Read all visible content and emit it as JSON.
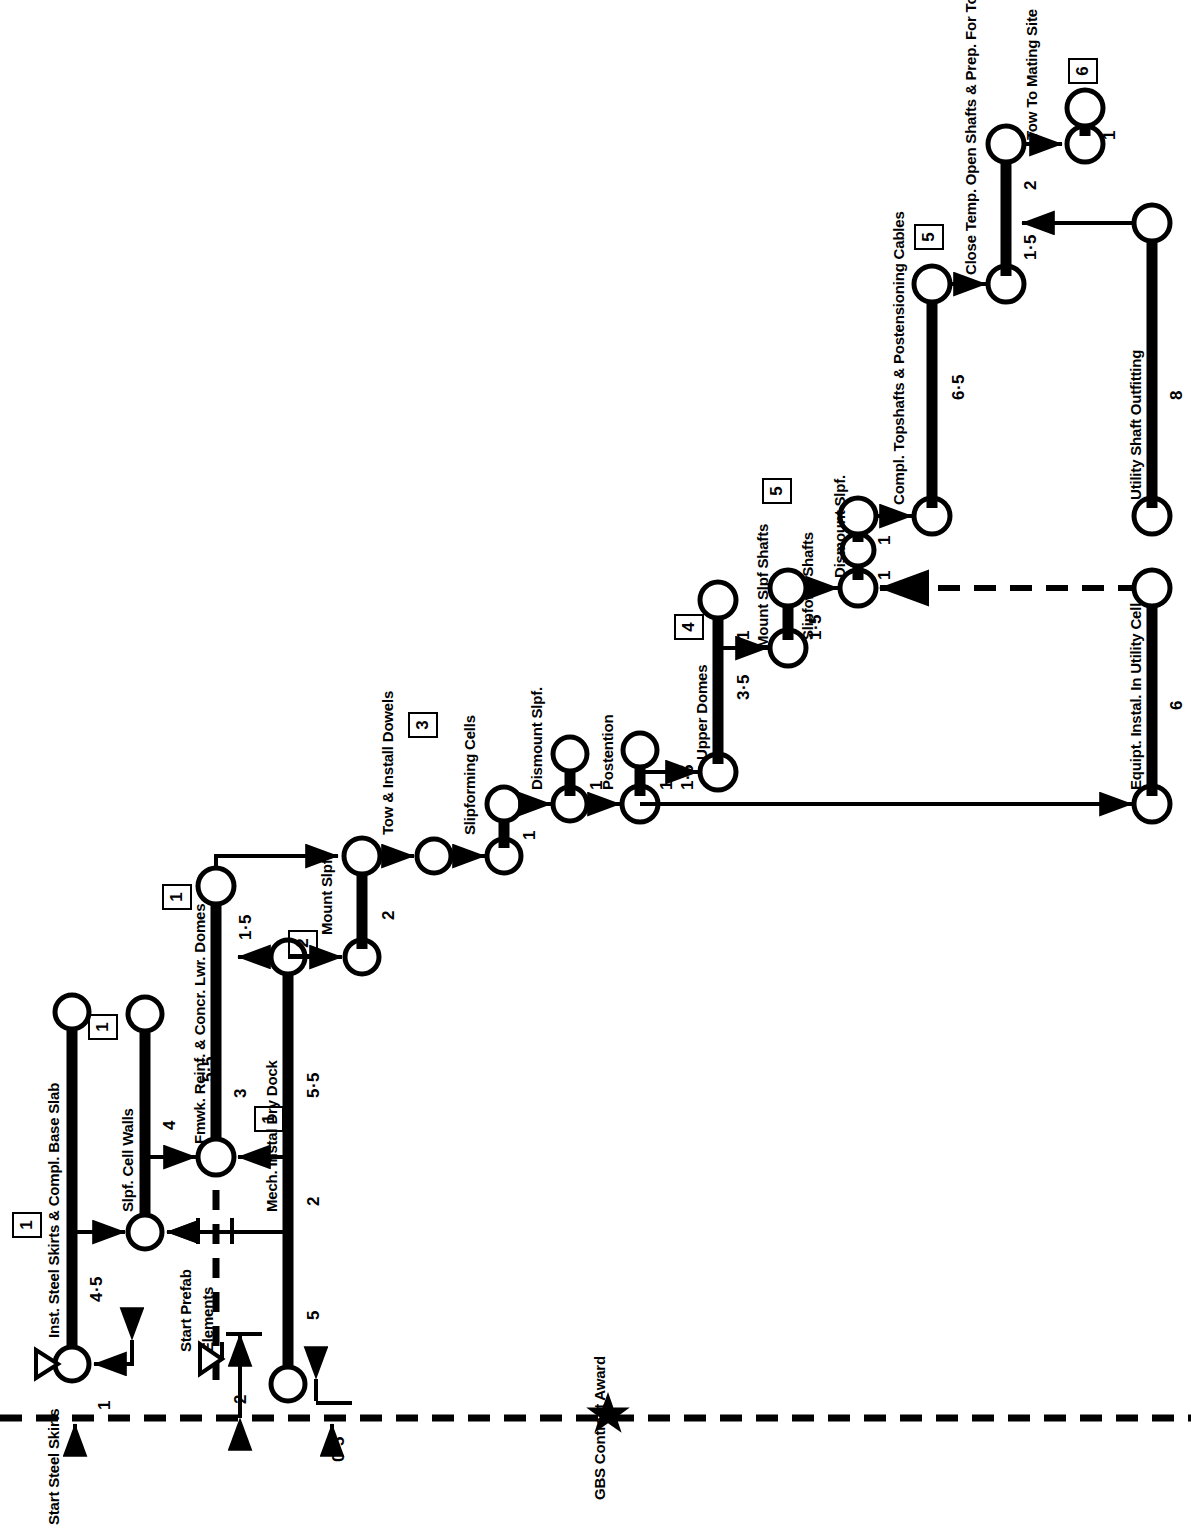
{
  "diagram": {
    "type": "cpm-arrow-network",
    "orientation": "rotated-90-ccw",
    "baseline_label": "GBS Contract Award",
    "milestones": [
      "1",
      "1",
      "1",
      "1",
      "2",
      "3",
      "4",
      "5",
      "5",
      "6"
    ],
    "events": [
      {
        "id": "start-steel-skirts",
        "label": "Start Steel Skirts"
      },
      {
        "id": "start-prefab-elements",
        "label": "Start Prefab Elements"
      },
      {
        "id": "gbs-contract-award",
        "label": "GBS Contract Award"
      }
    ],
    "activities": [
      {
        "id": "inst-steel-skirts",
        "label": "Inst. Steel Skirts & Compl. Base Slab",
        "duration": "4·5"
      },
      {
        "id": "slpf-cell-walls",
        "label": "Slpf. Cell Walls",
        "duration": "4"
      },
      {
        "id": "fmwk-reinf-concr",
        "label": "Fmwk. Reinf. & Concr. Lwr. Domes",
        "duration": "3"
      },
      {
        "id": "lwr-domes-arm",
        "label": "",
        "duration": "5·5"
      },
      {
        "id": "mech-instal-dry-dock",
        "label": "Mech. Instal Dry Dock",
        "duration": "5·5"
      },
      {
        "id": "mount-slpf",
        "label": "Mount Slpf.",
        "duration": "2"
      },
      {
        "id": "tow-install-dowels",
        "label": "Tow & Install Dowels",
        "duration": "1·5"
      },
      {
        "id": "slipforming-cells",
        "label": "Slipforming Cells",
        "duration": "1"
      },
      {
        "id": "dismount-slpf-1",
        "label": "Dismount Slpf.",
        "duration": "1"
      },
      {
        "id": "postention",
        "label": "Postention",
        "duration": "1·5"
      },
      {
        "id": "upper-domes",
        "label": "Upper Domes",
        "duration": "3·5"
      },
      {
        "id": "mount-slpf-shafts",
        "label": "Mount Slpf Shafts",
        "duration": "1"
      },
      {
        "id": "slipform-shafts",
        "label": "Slipform Shafts",
        "duration": "1·5"
      },
      {
        "id": "dismount-slpf-2",
        "label": "Dismount Slpf.",
        "duration": "1"
      },
      {
        "id": "compl-topshafts",
        "label": "Compl. Topshafts & Postensioning Cables",
        "duration": "6·5"
      },
      {
        "id": "close-temp-open-shafts",
        "label": "Close Temp. Open Shafts & Prep. For Tow",
        "duration": "1·5"
      },
      {
        "id": "tow-to-mating-site",
        "label": "Tow To Mating Site",
        "duration": "2"
      },
      {
        "id": "equipt-instal-util-cell",
        "label": "Equipt. Instal. In Utility Cell",
        "duration": "6"
      },
      {
        "id": "utility-shaft-outfitting",
        "label": "Utility Shaft Outfitting",
        "duration": "8"
      }
    ],
    "lead_durations": {
      "start_skirts_lead": "1",
      "mech_dry_dock_lead": "0·5",
      "prefab_offset": "2",
      "mount_slpf_short": "2",
      "dismount_1": "1",
      "dismount_2": "1",
      "dismount_3": "1",
      "dismount_4": "1",
      "postention_1": "1",
      "tow_mating_1": "1",
      "spur_1": "1",
      "spur_2": "1"
    },
    "colors": {
      "ink": "#000000",
      "paper": "#ffffff"
    },
    "marker_names": {
      "milestone_box": "milestone-box",
      "flag": "triangle-flag-icon",
      "star": "star-icon",
      "dashed_baseline": "dashed-baseline"
    }
  }
}
